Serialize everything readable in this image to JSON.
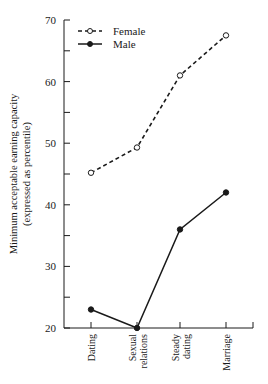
{
  "chart_data": {
    "type": "line",
    "title": "",
    "xlabel": "",
    "ylabel": "Minimum acceptable earning capacity",
    "ylabel_sub": "(expressed as percentile)",
    "categories": [
      "Dating",
      "Sexual relations",
      "Steady dating",
      "Marriage"
    ],
    "category_lines": [
      [
        "Dating"
      ],
      [
        "Sexual",
        "relations"
      ],
      [
        "Steady",
        "dating"
      ],
      [
        "Marriage"
      ]
    ],
    "ylim": [
      20,
      70
    ],
    "yticks_major": [
      20,
      30,
      40,
      50,
      60,
      70
    ],
    "yticks_minor": [
      25,
      35,
      45,
      55,
      65
    ],
    "grid": false,
    "legend_position": "upper left",
    "series": [
      {
        "name": "Female",
        "style": "dashed",
        "marker": "open-circle",
        "values": [
          45.2,
          49.3,
          61,
          67.5
        ]
      },
      {
        "name": "Male",
        "style": "solid",
        "marker": "filled-circle",
        "values": [
          23,
          20,
          36,
          42
        ]
      }
    ]
  },
  "colors": {
    "line": "#1a1a1a",
    "background": "#ffffff"
  }
}
